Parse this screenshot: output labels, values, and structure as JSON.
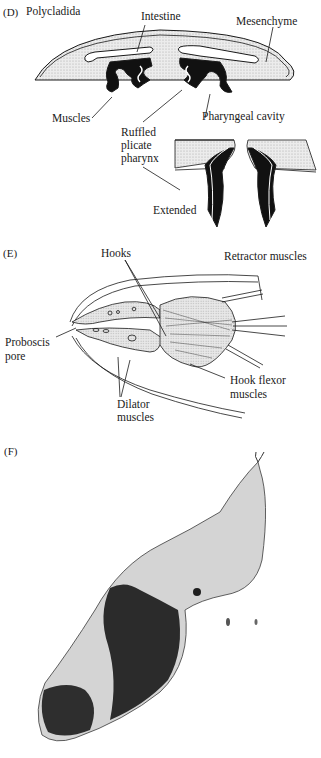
{
  "panels": {
    "D": {
      "letter": "(D)",
      "title": "Polycladida",
      "labels": {
        "intestine": "Intestine",
        "mesenchyme": "Mesenchyme",
        "muscles": "Muscles",
        "pharyngeal_cavity": "Pharyngeal cavity",
        "ruffled_1": "Ruffled",
        "ruffled_2": "plicate",
        "ruffled_3": "pharynx",
        "extended": "Extended"
      }
    },
    "E": {
      "letter": "(E)",
      "labels": {
        "hooks": "Hooks",
        "retractor_muscles": "Retractor muscles",
        "proboscis_1": "Proboscis",
        "proboscis_2": "pore",
        "hook_flexor_1": "Hook flexor",
        "hook_flexor_2": "muscles",
        "dilator_1": "Dilator",
        "dilator_2": "muscles"
      }
    },
    "F": {
      "letter": "(F)",
      "description": "micrograph-of-elongate-organism"
    }
  },
  "colors": {
    "ink": "#1a1a1a",
    "stipple": "#d9d9d9",
    "photo_bg": "#cacaca",
    "photo_dark": "#2a2a2a"
  }
}
